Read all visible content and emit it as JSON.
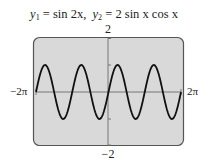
{
  "title": {
    "y1_label": "y",
    "y1_sub": "1",
    "y1_expr": " = sin 2x,",
    "y2_label": "y",
    "y2_sub": "2",
    "y2_expr": " = 2 sin x cos x"
  },
  "chart_data": {
    "type": "line",
    "series": [
      {
        "name": "y1 = sin 2x",
        "function": "sin(2x)"
      },
      {
        "name": "y2 = 2 sin x cos x",
        "function": "2*sin(x)*cos(x)"
      }
    ],
    "xlim": [
      "-2π",
      "2π"
    ],
    "ylim": [
      -2,
      2
    ],
    "x_tick_labels": [
      "-2π",
      "2π"
    ],
    "y_tick_labels": [
      "2",
      "-2"
    ],
    "y_ticks": [
      -2,
      -1,
      0,
      1,
      2
    ],
    "grid": false,
    "legend": "none",
    "note": "Both functions coincide; single curve displayed with 4 periods over [-2π, 2π]"
  },
  "labels": {
    "y_max": "2",
    "y_min": "−2",
    "x_min": "−2π",
    "x_max": "2π"
  },
  "colors": {
    "screen_bg": "#d9d9d9",
    "screen_border": "#555555",
    "curve": "#111111",
    "axis": "#777777"
  }
}
